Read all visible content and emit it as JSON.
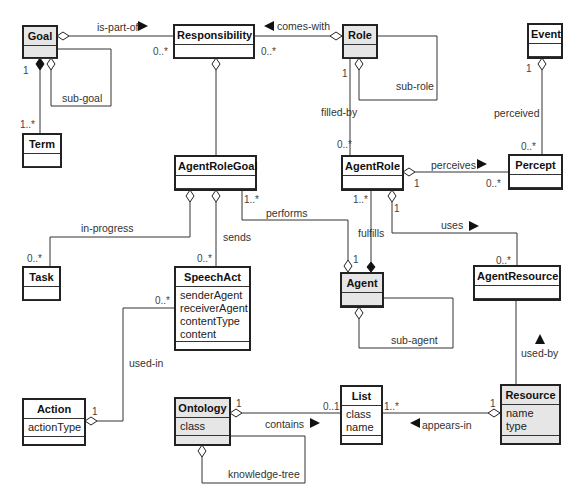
{
  "diagram": {
    "type": "uml-class-diagram",
    "classes": {
      "goal": {
        "name": "Goal",
        "attributes": [],
        "shaded": true
      },
      "term": {
        "name": "Term",
        "attributes": [],
        "shaded": false
      },
      "responsibility": {
        "name": "Responsibility",
        "attributes": [],
        "shaded": false
      },
      "role": {
        "name": "Role",
        "attributes": [],
        "shaded": true
      },
      "event": {
        "name": "Event",
        "attributes": [],
        "shaded": false
      },
      "agent_role_goal": {
        "name": "AgentRoleGoal",
        "attributes": [],
        "shaded": false
      },
      "agent_role": {
        "name": "AgentRole",
        "attributes": [],
        "shaded": false
      },
      "percept": {
        "name": "Percept",
        "attributes": [],
        "shaded": false
      },
      "task": {
        "name": "Task",
        "attributes": [],
        "shaded": false
      },
      "speech_act": {
        "name": "SpeechAct",
        "attributes": [
          "senderAgent",
          "receiverAgent",
          "contentType",
          "content"
        ],
        "attributes_text": "senderAgent\nreceiverAgent\ncontentType\ncontent",
        "shaded": false
      },
      "agent": {
        "name": "Agent",
        "attributes": [],
        "shaded": true
      },
      "agent_resource": {
        "name": "AgentResource",
        "attributes": [],
        "shaded": false
      },
      "action": {
        "name": "Action",
        "attributes": [
          "actionType"
        ],
        "attributes_text": "actionType",
        "shaded": false
      },
      "ontology": {
        "name": "Ontology",
        "attributes": [
          "class"
        ],
        "attributes_text": "class",
        "shaded": true
      },
      "list": {
        "name": "List",
        "attributes": [
          "class",
          "name"
        ],
        "attributes_text": "class\nname",
        "shaded": false
      },
      "resource": {
        "name": "Resource",
        "attributes": [
          "name",
          "type"
        ],
        "attributes_text": "name\ntype",
        "shaded": true
      }
    },
    "associations": {
      "is_part_of": {
        "label": "is-part-of",
        "from": "Goal",
        "to": "Responsibility",
        "kind": "aggregation",
        "mult_from": "",
        "mult_to": "0..*",
        "direction": "right"
      },
      "sub_goal": {
        "label": "sub-goal",
        "from": "Goal",
        "to": "Goal",
        "kind": "aggregation"
      },
      "goal_term": {
        "label": "",
        "from": "Goal",
        "to": "Term",
        "kind": "composition",
        "mult_from": "1",
        "mult_to": "1..*"
      },
      "comes_with": {
        "label": "comes-with",
        "from": "Role",
        "to": "Responsibility",
        "kind": "aggregation",
        "mult_to": "0..*",
        "direction": "left"
      },
      "sub_role": {
        "label": "sub-role",
        "from": "Role",
        "to": "Role",
        "kind": "aggregation"
      },
      "filled_by": {
        "label": "filled-by",
        "from": "Role",
        "to": "AgentRole",
        "mult_from": "1",
        "mult_to": "0..*"
      },
      "responsibility_arg": {
        "label": "",
        "from": "Responsibility",
        "to": "AgentRoleGoal",
        "kind": "aggregation"
      },
      "perceived": {
        "label": "perceived",
        "from": "Event",
        "to": "Percept",
        "kind": "aggregation",
        "mult_from": "1",
        "mult_to": "0..*"
      },
      "perceives": {
        "label": "perceives",
        "from": "AgentRole",
        "to": "Percept",
        "kind": "aggregation",
        "mult_from": "1",
        "mult_to": "0..*",
        "direction": "right"
      },
      "in_progress": {
        "label": "in-progress",
        "from": "AgentRoleGoal",
        "to": "Task",
        "kind": "aggregation",
        "mult_to": "0..*"
      },
      "sends": {
        "label": "sends",
        "from": "AgentRoleGoal",
        "to": "SpeechAct",
        "kind": "aggregation",
        "mult_to": "0..*"
      },
      "performs": {
        "label": "performs",
        "from": "AgentRoleGoal",
        "to": "Agent",
        "kind": "aggregation",
        "mult_from": "1..*",
        "mult_to": "1"
      },
      "fulfills": {
        "label": "fulfills",
        "from": "AgentRole",
        "to": "Agent",
        "kind": "composition",
        "mult_from": "1..*"
      },
      "uses": {
        "label": "uses",
        "from": "AgentRole",
        "to": "AgentResource",
        "kind": "aggregation",
        "mult_from": "1",
        "mult_to": "0..*",
        "direction": "right"
      },
      "sub_agent": {
        "label": "sub-agent",
        "from": "Agent",
        "to": "Agent",
        "kind": "aggregation"
      },
      "used_by": {
        "label": "used-by",
        "from": "Resource",
        "to": "AgentResource",
        "direction": "up"
      },
      "used_in": {
        "label": "used-in",
        "from": "Action",
        "to": "SpeechAct",
        "kind": "aggregation",
        "mult_from": "1",
        "mult_to": "0..*"
      },
      "contains": {
        "label": "contains",
        "from": "Ontology",
        "to": "List",
        "kind": "aggregation",
        "mult_from": "1",
        "mult_to": "0..1",
        "direction": "right"
      },
      "knowledge_tree": {
        "label": "knowledge-tree",
        "from": "Ontology",
        "to": "Ontology",
        "kind": "aggregation"
      },
      "appears_in": {
        "label": "appears-in",
        "from": "Resource",
        "to": "List",
        "kind": "aggregation",
        "mult_from": "1",
        "mult_to": "1..*",
        "direction": "left"
      }
    },
    "multiplicities": {
      "goal_term_1": "1",
      "goal_term_many": "1..*",
      "resp_left": "0..*",
      "resp_right": "0..*",
      "role_filled_1": "1",
      "agentrole_filled": "0..*",
      "event_1": "1",
      "percept_top": "0..*",
      "agentrole_perceives_1": "1",
      "percept_left": "0..*",
      "task_top": "0..*",
      "speechact_top": "0..*",
      "arg_performs": "1..*",
      "agent_performs_1": "1",
      "agentrole_fulfills": "1..*",
      "agentrole_uses_1": "1",
      "agentresource_top": "0..*",
      "speechact_left": "0..*",
      "action_1": "1",
      "ontology_1": "1",
      "list_left": "0..1",
      "list_right": "1..*",
      "resource_1": "1"
    }
  },
  "colors": {
    "line": "#333333",
    "border": "#222222",
    "shaded_fill": "#e6e6e6",
    "arrow": "#111111",
    "background": "#ffffff"
  }
}
